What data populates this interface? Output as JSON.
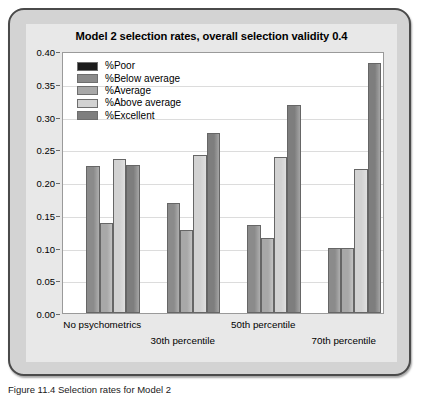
{
  "figure": {
    "caption": "Figure 11.4  Selection rates for Model 2"
  },
  "chart_data": {
    "type": "bar",
    "title": "Model 2 selection rates, overall selection validity 0.4",
    "xlabel": "",
    "ylabel": "",
    "ylim": [
      0.0,
      0.4
    ],
    "ytick_labels": [
      "0.00",
      "0.05",
      "0.10",
      "0.15",
      "0.20",
      "0.25",
      "0.30",
      "0.35",
      "0.40"
    ],
    "ytick_values": [
      0.0,
      0.05,
      0.1,
      0.15,
      0.2,
      0.25,
      0.3,
      0.35,
      0.4
    ],
    "grid": true,
    "legend_position": "upper-left",
    "categories": [
      "No psychometrics",
      "30th percentile",
      "50th percentile",
      "70th percentile"
    ],
    "series": [
      {
        "name": "%Poor",
        "color": "#1c1c1c",
        "values": [
          0.0,
          0.0,
          0.0,
          0.0
        ]
      },
      {
        "name": "%Below average",
        "color": "#8b8b8b",
        "values": [
          0.225,
          0.168,
          0.134,
          0.1
        ]
      },
      {
        "name": "%Average",
        "color": "#a8a8a8",
        "values": [
          0.138,
          0.126,
          0.115,
          0.1
        ]
      },
      {
        "name": "%Above average",
        "color": "#d2d2d2",
        "values": [
          0.235,
          0.242,
          0.238,
          0.22
        ]
      },
      {
        "name": "%Excellent",
        "color": "#7e7e7e",
        "values": [
          0.226,
          0.275,
          0.317,
          0.381
        ]
      }
    ]
  },
  "colors": {
    "frame_border": "#4a4a4a",
    "frame_fill": "#d3d3d3",
    "panel_fill": "#e8e8e8",
    "plot_background": "#ffffff",
    "gridline": "#dcdcdc",
    "axis": "#9a9a9a",
    "text": "#000000"
  }
}
